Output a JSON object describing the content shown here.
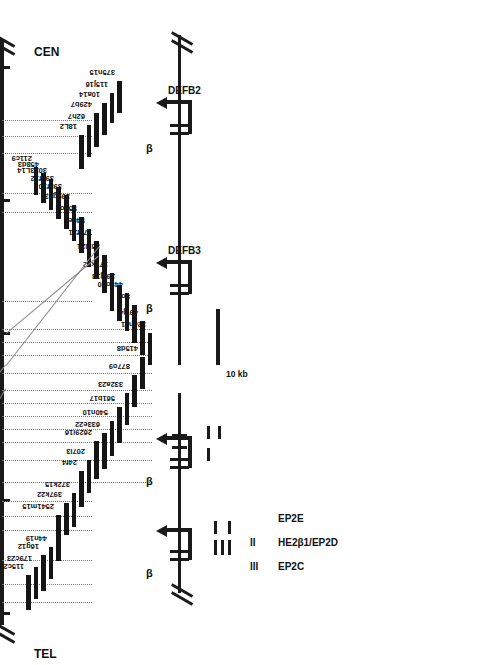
{
  "figure": {
    "type": "genomic-contig-map",
    "orientation_note": "figure printed sideways; axis TEL at bottom, CEN at top",
    "tel_label": "TEL",
    "cen_label": "CEN"
  },
  "scale_rows": [
    {
      "key": "mb",
      "label": "Mb"
    },
    {
      "key": "cm",
      "label": "cM"
    },
    {
      "key": "cr",
      "label": "cR"
    }
  ],
  "scale_values": {
    "mb": [
      {
        "text": "1",
        "pos": 158
      },
      {
        "text": "2",
        "pos": 330
      },
      {
        "text": "3",
        "pos": 468
      },
      {
        "text": "4",
        "pos": 592
      }
    ],
    "cm": [
      {
        "text": "7.6",
        "pos": 92
      },
      {
        "text": "8",
        "pos": 131
      },
      {
        "text": "8",
        "pos": 158
      },
      {
        "text": "10",
        "pos": 232
      },
      {
        "text": "10.5",
        "pos": 288
      },
      {
        "text": "15",
        "pos": 455
      },
      {
        "text": "15",
        "pos": 478
      },
      {
        "text": "16",
        "pos": 520
      },
      {
        "text": "16",
        "pos": 538
      },
      {
        "text": "16",
        "pos": 566
      }
    ],
    "cr": [
      {
        "text": "31",
        "pos": 62
      },
      {
        "text": "33",
        "pos": 99
      },
      {
        "text": "34",
        "pos": 144
      },
      {
        "text": "44",
        "pos": 528
      }
    ]
  },
  "markers": [
    {
      "name": "D8S1099",
      "pos": 62,
      "leader": 1
    },
    {
      "name": "D8S1742",
      "pos": 80,
      "leader": 1
    },
    {
      "name": "A004x20",
      "pos": 104,
      "leader": 1
    },
    {
      "name": "D8S277",
      "pos": 134,
      "leader": 1
    },
    {
      "name": "D8S1511",
      "pos": 148,
      "leader": 1
    },
    {
      "name": "D8S561",
      "pos": 163,
      "leader": 1
    },
    {
      "name": "DEFB1",
      "pos": 182,
      "leader": 2
    },
    {
      "name": "D8S1819/D8S439",
      "pos": 204,
      "leader": 2
    },
    {
      "name": "DEFA6",
      "pos": 222,
      "leader": 2
    },
    {
      "name": "DEFA4",
      "pos": 235,
      "leader": 2
    },
    {
      "name": "DEFA1/3",
      "pos": 248,
      "leader": 2
    },
    {
      "name": "DEFA7",
      "pos": 261,
      "leader": 2
    },
    {
      "name": "DEFA5",
      "pos": 274,
      "leader": 2
    },
    {
      "name": "D8S1706",
      "pos": 291,
      "leader": 2
    },
    {
      "name": "HE2/EP2",
      "pos": 309,
      "leader": 2
    },
    {
      "name": "DEFB3",
      "pos": 322,
      "leader": 2
    },
    {
      "name": "DEFB2",
      "pos": 335,
      "leader": 2
    },
    {
      "name": "WI-4625",
      "pos": 363,
      "leader": 1
    },
    {
      "name": "D8S351",
      "pos": 452,
      "leader": 1
    },
    {
      "name": "D8S1825",
      "pos": 471,
      "leader": 1
    },
    {
      "name": "GCT10E01",
      "pos": 511,
      "leader": 1
    },
    {
      "name": "D8S1469",
      "pos": 528,
      "leader": 1
    },
    {
      "name": "D8S503",
      "pos": 544,
      "leader": 1
    },
    {
      "name": "D8S542",
      "pos": 570,
      "leader": 0
    }
  ],
  "axis_ticks": [
    50,
    163,
    330,
    463,
    596
  ],
  "clones": [
    {
      "name": "115c21",
      "start": 55,
      "end": 90,
      "tier": 0
    },
    {
      "name": "179c23",
      "start": 66,
      "end": 98,
      "tier": 1
    },
    {
      "name": "16g12",
      "start": 74,
      "end": 110,
      "tier": 2
    },
    {
      "name": "44n19",
      "start": 86,
      "end": 118,
      "tier": 3
    },
    {
      "name": "2541m15",
      "start": 104,
      "end": 150,
      "tier": 4
    },
    {
      "name": "397k22",
      "start": 130,
      "end": 162,
      "tier": 5
    },
    {
      "name": "372k15",
      "start": 138,
      "end": 172,
      "tier": 6
    },
    {
      "name": "24f4",
      "start": 158,
      "end": 194,
      "tier": 7
    },
    {
      "name": "207l3",
      "start": 172,
      "end": 205,
      "tier": 8
    },
    {
      "name": "2629i16",
      "start": 186,
      "end": 224,
      "tier": 9
    },
    {
      "name": "633e22",
      "start": 196,
      "end": 232,
      "tier": 10
    },
    {
      "name": "540n10",
      "start": 209,
      "end": 244,
      "tier": 11
    },
    {
      "name": "561b17",
      "start": 222,
      "end": 258,
      "tier": 12
    },
    {
      "name": "332a23",
      "start": 240,
      "end": 272,
      "tier": 13
    },
    {
      "name": "877o9",
      "start": 258,
      "end": 290,
      "tier": 14
    },
    {
      "name": "415d8",
      "start": 276,
      "end": 308,
      "tier": 15
    },
    {
      "name": "324n11",
      "start": 300,
      "end": 332,
      "tier": 16
    },
    {
      "name": "497j4",
      "start": 310,
      "end": 344,
      "tier": 15
    },
    {
      "name": "8o7",
      "start": 322,
      "end": 360,
      "tier": 14
    },
    {
      "name": "449o20",
      "start": 334,
      "end": 372,
      "tier": 13
    },
    {
      "name": "295j18",
      "start": 344,
      "end": 380,
      "tier": 12
    },
    {
      "name": "177k12",
      "start": 354,
      "end": 392,
      "tier": 11
    },
    {
      "name": "351l21",
      "start": 372,
      "end": 410,
      "tier": 10
    },
    {
      "name": "776f21",
      "start": 386,
      "end": 424,
      "tier": 9
    },
    {
      "name": "540e4",
      "start": 398,
      "end": 436,
      "tier": 8
    },
    {
      "name": "556o5",
      "start": 412,
      "end": 448,
      "tier": 7
    },
    {
      "name": "399g23",
      "start": 424,
      "end": 460,
      "tier": 6
    },
    {
      "name": "398f10",
      "start": 436,
      "end": 470,
      "tier": 5
    },
    {
      "name": "398f12",
      "start": 446,
      "end": 478,
      "tier": 4
    },
    {
      "name": "3023L14",
      "start": 455,
      "end": 486,
      "tier": 3
    },
    {
      "name": "458d3",
      "start": 462,
      "end": 492,
      "tier": 2
    },
    {
      "name": "211c9",
      "start": 470,
      "end": 498,
      "tier": 1
    },
    {
      "name": "18L2",
      "start": 496,
      "end": 530,
      "tier": 7
    },
    {
      "name": "62h7",
      "start": 508,
      "end": 540,
      "tier": 8
    },
    {
      "name": "429b7",
      "start": 518,
      "end": 552,
      "tier": 9
    },
    {
      "name": "10a14",
      "start": 530,
      "end": 562,
      "tier": 10
    },
    {
      "name": "115j16",
      "start": 542,
      "end": 572,
      "tier": 11
    },
    {
      "name": "375n15",
      "start": 552,
      "end": 584,
      "tier": 12
    }
  ],
  "panels": {
    "defensin_beta": {
      "genes": [
        {
          "label": "DEFB3",
          "beta": "β"
        },
        {
          "label": "DEFB2",
          "beta": "β"
        }
      ],
      "scalebar_label": "10 kb"
    },
    "he2_ep2": {
      "row_labels": [
        {
          "text": "EP2C"
        },
        {
          "text": "HE2β1/EP2D"
        },
        {
          "text": "EP2E"
        }
      ],
      "roman": [
        {
          "text": "III"
        },
        {
          "text": "II"
        }
      ],
      "betas": [
        {
          "text": "β"
        },
        {
          "text": "β"
        }
      ]
    }
  }
}
